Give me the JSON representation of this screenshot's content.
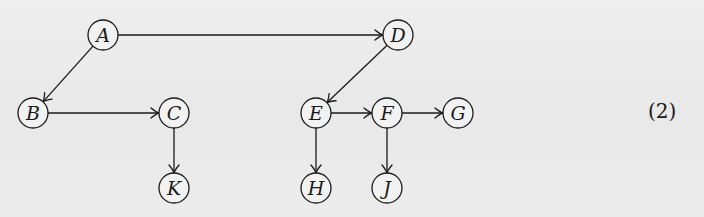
{
  "diagram": {
    "type": "directed-graph",
    "node_radius": 15,
    "nodes": [
      {
        "id": "A",
        "label": "A",
        "x": 103,
        "y": 35
      },
      {
        "id": "D",
        "label": "D",
        "x": 398,
        "y": 35
      },
      {
        "id": "B",
        "label": "B",
        "x": 33,
        "y": 113
      },
      {
        "id": "C",
        "label": "C",
        "x": 174,
        "y": 113
      },
      {
        "id": "E",
        "label": "E",
        "x": 316,
        "y": 113
      },
      {
        "id": "F",
        "label": "F",
        "x": 387,
        "y": 113
      },
      {
        "id": "G",
        "label": "G",
        "x": 458,
        "y": 113
      },
      {
        "id": "K",
        "label": "K",
        "x": 174,
        "y": 188
      },
      {
        "id": "H",
        "label": "H",
        "x": 316,
        "y": 188
      },
      {
        "id": "J",
        "label": "J",
        "x": 387,
        "y": 188
      }
    ],
    "edges": [
      {
        "from": "A",
        "to": "D"
      },
      {
        "from": "A",
        "to": "B"
      },
      {
        "from": "B",
        "to": "C"
      },
      {
        "from": "C",
        "to": "K"
      },
      {
        "from": "D",
        "to": "E"
      },
      {
        "from": "E",
        "to": "F"
      },
      {
        "from": "F",
        "to": "G"
      },
      {
        "from": "E",
        "to": "H"
      },
      {
        "from": "F",
        "to": "J"
      }
    ]
  },
  "equation_number": "(2)",
  "colors": {
    "ink": "#1a1a1a",
    "paper": "#ededed"
  }
}
